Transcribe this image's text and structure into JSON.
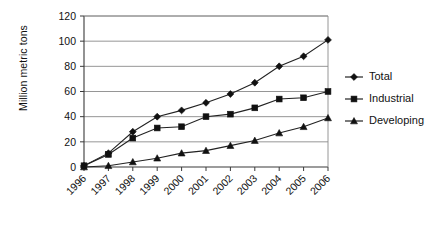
{
  "chart_data": {
    "type": "line",
    "title": "",
    "xlabel": "",
    "ylabel": "Million metric tons",
    "categories": [
      "1996",
      "1997",
      "1998",
      "1999",
      "2000",
      "2001",
      "2002",
      "2003",
      "2004",
      "2005",
      "2006"
    ],
    "ylim": [
      0,
      120
    ],
    "yticks": [
      0,
      20,
      40,
      60,
      80,
      100,
      120
    ],
    "ytick_labels": [
      "0",
      "20",
      "40",
      "60",
      "80",
      "100",
      "120"
    ],
    "grid": "horizontal",
    "legend_position": "right",
    "series": [
      {
        "name": "Total",
        "marker": "diamond",
        "color": "#111111",
        "values": [
          1,
          11,
          28,
          40,
          45,
          51,
          58,
          67,
          80,
          88,
          101
        ]
      },
      {
        "name": "Industrial",
        "marker": "square",
        "color": "#111111",
        "values": [
          1,
          10,
          23,
          31,
          32,
          40,
          42,
          47,
          54,
          55,
          60
        ]
      },
      {
        "name": "Developing",
        "marker": "triangle",
        "color": "#111111",
        "values": [
          0,
          1,
          4,
          7,
          11,
          13,
          17,
          21,
          27,
          32,
          39
        ]
      }
    ]
  }
}
